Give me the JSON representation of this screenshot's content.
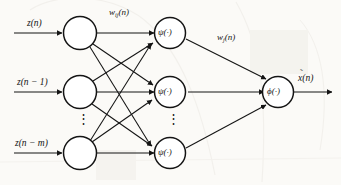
{
  "figure": {
    "background_color": "#fbfaf7",
    "stroke_color": "#141414"
  },
  "inputs": [
    {
      "label": "z(n)",
      "node_name": "input-node-1"
    },
    {
      "label": "z(n − 1)",
      "node_name": "input-node-2"
    },
    {
      "label": "z(n − m)",
      "node_name": "input-node-3"
    }
  ],
  "weights": {
    "first_layer": {
      "symbol": "w",
      "subscript": "ij",
      "argument": "(n)"
    },
    "second_layer": {
      "symbol": "w",
      "subscript": "j",
      "argument": "(n)"
    }
  },
  "hidden_layer": {
    "activation": "ψ(·)",
    "count_shown": 3,
    "ellipsis": "⋮"
  },
  "input_layer": {
    "count_shown": 3,
    "ellipsis": "⋮"
  },
  "output_layer": {
    "activation": "ϕ(·)"
  },
  "output": {
    "base": "x",
    "accent": "̃",
    "argument": "(n)"
  }
}
